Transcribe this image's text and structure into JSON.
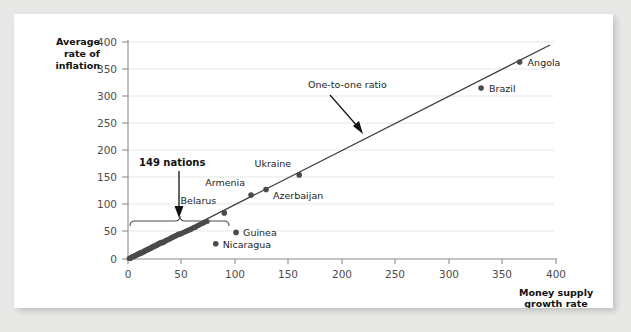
{
  "figure": {
    "background_color": "#ffffff",
    "page_background_color": "#e8e8e6"
  },
  "chart_data": {
    "type": "scatter",
    "title": "",
    "xlabel": "Money supply growth rate",
    "ylabel": "Average rate of inflation",
    "xlim": [
      0,
      400
    ],
    "ylim": [
      0,
      400
    ],
    "xticks": [
      "0",
      "50",
      "100",
      "150",
      "200",
      "250",
      "300",
      "350",
      "400"
    ],
    "yticks": [
      "0",
      "50",
      "100",
      "150",
      "200",
      "250",
      "300",
      "350",
      "400"
    ],
    "xtick_values": [
      0,
      50,
      100,
      150,
      200,
      250,
      300,
      350,
      400
    ],
    "ytick_values": [
      0,
      50,
      100,
      150,
      200,
      250,
      300,
      350,
      400
    ],
    "grid": "horizontal",
    "grid_color": "#e4e4e4",
    "legend": "none",
    "marker_color": "#4a4a4a",
    "line_color": "#3c3c3c",
    "labeled_points": [
      {
        "name": "Angola",
        "x": 366,
        "y": 363,
        "label_dx": 8,
        "label_dy": 4
      },
      {
        "name": "Brazil",
        "x": 330,
        "y": 315,
        "label_dx": 8,
        "label_dy": 4
      },
      {
        "name": "Ukraine",
        "x": 160,
        "y": 155,
        "label_dx": -8,
        "label_dy": -8,
        "anchor": "end"
      },
      {
        "name": "Azerbaijan",
        "x": 129,
        "y": 128,
        "label_dx": 7,
        "label_dy": 9
      },
      {
        "name": "Armenia",
        "x": 115,
        "y": 118,
        "label_dx": -6,
        "label_dy": -9,
        "anchor": "end"
      },
      {
        "name": "Belarus",
        "x": 90,
        "y": 85,
        "label_dx": -8,
        "label_dy": -9,
        "anchor": "end"
      },
      {
        "name": "Guinea",
        "x": 101,
        "y": 49,
        "label_dx": 7,
        "label_dy": 4
      },
      {
        "name": "Nicaragua",
        "x": 82,
        "y": 28,
        "label_dx": 7,
        "label_dy": 4
      }
    ],
    "cluster_points": [
      {
        "x": 2,
        "y": 2
      },
      {
        "x": 3,
        "y": 3
      },
      {
        "x": 4,
        "y": 3
      },
      {
        "x": 5,
        "y": 5
      },
      {
        "x": 6,
        "y": 5
      },
      {
        "x": 7,
        "y": 6
      },
      {
        "x": 8,
        "y": 7
      },
      {
        "x": 9,
        "y": 8
      },
      {
        "x": 10,
        "y": 9
      },
      {
        "x": 11,
        "y": 9
      },
      {
        "x": 12,
        "y": 11
      },
      {
        "x": 13,
        "y": 11
      },
      {
        "x": 14,
        "y": 13
      },
      {
        "x": 15,
        "y": 13
      },
      {
        "x": 16,
        "y": 15
      },
      {
        "x": 17,
        "y": 15
      },
      {
        "x": 18,
        "y": 17
      },
      {
        "x": 19,
        "y": 17
      },
      {
        "x": 20,
        "y": 19
      },
      {
        "x": 21,
        "y": 19
      },
      {
        "x": 22,
        "y": 21
      },
      {
        "x": 23,
        "y": 21
      },
      {
        "x": 24,
        "y": 23
      },
      {
        "x": 25,
        "y": 23
      },
      {
        "x": 26,
        "y": 25
      },
      {
        "x": 27,
        "y": 25
      },
      {
        "x": 28,
        "y": 27
      },
      {
        "x": 29,
        "y": 27
      },
      {
        "x": 30,
        "y": 29
      },
      {
        "x": 31,
        "y": 29
      },
      {
        "x": 32,
        "y": 31
      },
      {
        "x": 33,
        "y": 30
      },
      {
        "x": 34,
        "y": 32
      },
      {
        "x": 35,
        "y": 33
      },
      {
        "x": 36,
        "y": 34
      },
      {
        "x": 37,
        "y": 35
      },
      {
        "x": 38,
        "y": 36
      },
      {
        "x": 39,
        "y": 37
      },
      {
        "x": 40,
        "y": 38
      },
      {
        "x": 41,
        "y": 39
      },
      {
        "x": 42,
        "y": 40
      },
      {
        "x": 43,
        "y": 41
      },
      {
        "x": 44,
        "y": 42
      },
      {
        "x": 45,
        "y": 43
      },
      {
        "x": 46,
        "y": 44
      },
      {
        "x": 47,
        "y": 45
      },
      {
        "x": 48,
        "y": 45
      },
      {
        "x": 49,
        "y": 46
      },
      {
        "x": 50,
        "y": 47
      },
      {
        "x": 51,
        "y": 48
      },
      {
        "x": 53,
        "y": 50
      },
      {
        "x": 55,
        "y": 51
      },
      {
        "x": 57,
        "y": 53
      },
      {
        "x": 59,
        "y": 55
      },
      {
        "x": 61,
        "y": 57
      },
      {
        "x": 63,
        "y": 58
      },
      {
        "x": 65,
        "y": 61
      },
      {
        "x": 68,
        "y": 64
      },
      {
        "x": 71,
        "y": 67
      },
      {
        "x": 74,
        "y": 69
      },
      {
        "x": 1,
        "y": 1
      },
      {
        "x": 2,
        "y": 1
      },
      {
        "x": 3,
        "y": 2
      },
      {
        "x": 4,
        "y": 4
      },
      {
        "x": 5,
        "y": 4
      },
      {
        "x": 6,
        "y": 6
      },
      {
        "x": 7,
        "y": 7
      },
      {
        "x": 8,
        "y": 8
      },
      {
        "x": 9,
        "y": 9
      },
      {
        "x": 10,
        "y": 10
      },
      {
        "x": 11,
        "y": 11
      },
      {
        "x": 12,
        "y": 12
      },
      {
        "x": 13,
        "y": 12
      },
      {
        "x": 14,
        "y": 14
      },
      {
        "x": 15,
        "y": 14
      },
      {
        "x": 16,
        "y": 16
      },
      {
        "x": 17,
        "y": 16
      },
      {
        "x": 18,
        "y": 18
      },
      {
        "x": 19,
        "y": 18
      },
      {
        "x": 20,
        "y": 20
      },
      {
        "x": 21,
        "y": 20
      },
      {
        "x": 22,
        "y": 22
      },
      {
        "x": 23,
        "y": 22
      },
      {
        "x": 24,
        "y": 24
      },
      {
        "x": 25,
        "y": 24
      },
      {
        "x": 26,
        "y": 26
      },
      {
        "x": 27,
        "y": 26
      },
      {
        "x": 28,
        "y": 28
      },
      {
        "x": 29,
        "y": 28
      },
      {
        "x": 30,
        "y": 30
      },
      {
        "x": 31,
        "y": 31
      },
      {
        "x": 33,
        "y": 32
      },
      {
        "x": 35,
        "y": 34
      },
      {
        "x": 37,
        "y": 36
      },
      {
        "x": 39,
        "y": 38
      },
      {
        "x": 41,
        "y": 40
      },
      {
        "x": 43,
        "y": 42
      },
      {
        "x": 45,
        "y": 44
      },
      {
        "x": 47,
        "y": 46
      },
      {
        "x": 49,
        "y": 47
      },
      {
        "x": 52,
        "y": 49
      },
      {
        "x": 54,
        "y": 51
      },
      {
        "x": 56,
        "y": 53
      },
      {
        "x": 58,
        "y": 54
      },
      {
        "x": 60,
        "y": 56
      },
      {
        "x": 62,
        "y": 58
      },
      {
        "x": 66,
        "y": 62
      },
      {
        "x": 70,
        "y": 66
      }
    ],
    "reference_line": {
      "name": "One-to-one ratio",
      "from": [
        0,
        0
      ],
      "to": [
        395,
        395
      ]
    },
    "annotations": [
      {
        "name": "nations-count",
        "text": "149 nations",
        "text_x": 35,
        "text_y": 152,
        "arrow_from": [
          35,
          137
        ],
        "arrow_to": [
          35,
          97
        ],
        "brace_from_x": 0,
        "brace_to_x": 70,
        "brace_y": 88
      },
      {
        "name": "one-to-one-ratio",
        "text": "One-to-one ratio",
        "text_x": 188,
        "text_y": 288,
        "arrow_from": [
          205,
          275
        ],
        "arrow_to": [
          233,
          238
        ]
      }
    ]
  }
}
